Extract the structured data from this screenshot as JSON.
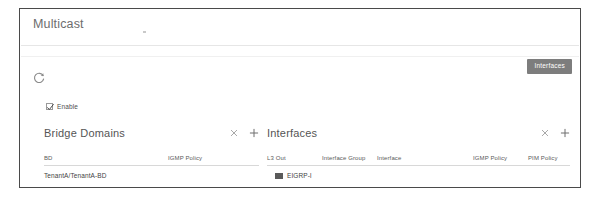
{
  "panel": {
    "title": "Multicast"
  },
  "toolbar": {
    "tooltip_label": "Interfaces",
    "refresh_icon": "refresh-icon"
  },
  "enable": {
    "label": "Enable",
    "checked": true
  },
  "sections": [
    {
      "key": "bridge_domains",
      "title": "Bridge Domains",
      "actions": {
        "delete_label": "×",
        "add_label": "+"
      },
      "columns": [
        {
          "label": "BD",
          "x": 0
        },
        {
          "label": "IGMP Policy",
          "x": 124
        }
      ],
      "rows": [
        {
          "cells": [
            "TenantA/TenantA-BD",
            ""
          ],
          "icon": null
        }
      ]
    },
    {
      "key": "interfaces",
      "title": "Interfaces",
      "actions": {
        "delete_label": "×",
        "add_label": "+"
      },
      "columns": [
        {
          "label": "L3 Out",
          "x": 0
        },
        {
          "label": "Interface Group",
          "x": 55
        },
        {
          "label": "Interface",
          "x": 110
        },
        {
          "label": "IGMP Policy",
          "x": 206
        },
        {
          "label": "PIM Policy",
          "x": 261
        }
      ],
      "rows": [
        {
          "cells": [
            "EIGRP-l",
            "",
            "",
            "",
            ""
          ],
          "icon": "square-node-icon"
        }
      ]
    }
  ],
  "colors": {
    "panel_border": "#4a4a4a",
    "tooltip_bg": "#7d7d7d",
    "text_primary": "#3f3f3f",
    "text_muted": "#6d6d6d",
    "divider": "#e6e6e6"
  }
}
